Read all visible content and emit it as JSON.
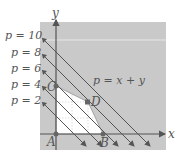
{
  "figure": {
    "type": "linear-programming-diagram",
    "axes": {
      "x_label": "x",
      "y_label": "y"
    },
    "objective_label": "p = x + y",
    "level_lines": [
      {
        "label": "p = 10",
        "p": 10
      },
      {
        "label": "p = 8",
        "p": 8
      },
      {
        "label": "p = 6",
        "p": 6
      },
      {
        "label": "p = 4",
        "p": 4
      },
      {
        "label": "p = 2",
        "p": 2
      }
    ],
    "vertices": [
      {
        "name": "A"
      },
      {
        "name": "B"
      },
      {
        "name": "C"
      },
      {
        "name": "D"
      }
    ],
    "colors": {
      "background_panel": "#c9c9c9",
      "feasible_region": "#ffffff",
      "lines": "#555555",
      "points": "#666666",
      "text": "#555555"
    }
  }
}
